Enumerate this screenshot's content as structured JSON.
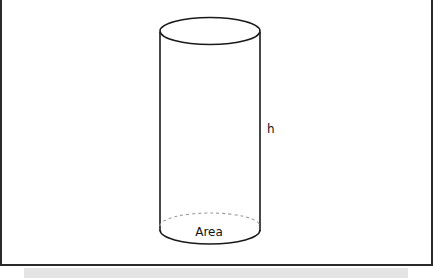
{
  "diagram": {
    "type": "cylinder",
    "labels": {
      "height": "h",
      "base": "Area"
    },
    "colors": {
      "stroke": "#1a1a1a",
      "dashed": "#9a9a9a",
      "frame": "#2a2a2a",
      "strip": "#e4e4e4"
    }
  }
}
